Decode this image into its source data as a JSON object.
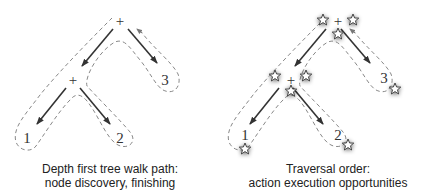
{
  "left_panel": {
    "caption_line1": "Depth first tree walk path:",
    "caption_line2": "node discovery, finishing",
    "nodes": {
      "root": "+",
      "inner": "+",
      "leaf1": "1",
      "leaf2": "2",
      "leaf3": "3"
    }
  },
  "right_panel": {
    "caption_line1": "Traversal order:",
    "caption_line2": "action execution opportunities",
    "nodes": {
      "root": "+",
      "inner": "+",
      "leaf1": "1",
      "leaf2": "2",
      "leaf3": "3"
    },
    "markers": "star-icon"
  },
  "colors": {
    "edge": "#333333",
    "path": "#888888",
    "star_fill": "#ffffff",
    "star_stroke": "#444444"
  }
}
